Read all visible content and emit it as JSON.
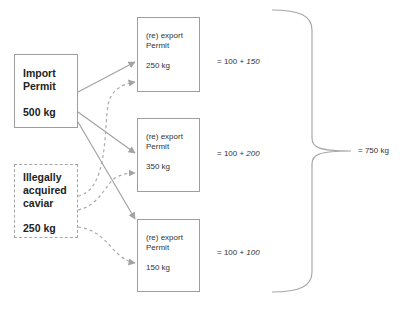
{
  "colors": {
    "line": "#a3a3a3",
    "box_border": "#9e9e9e",
    "text": "#222222"
  },
  "import_box": {
    "title_line1": "Import",
    "title_line2": "Permit",
    "amount": "500 kg"
  },
  "illegal_box": {
    "title_line1": "Illegally",
    "title_line2": "acquired",
    "title_line3": "caviar",
    "amount": "250 kg"
  },
  "export_boxes": [
    {
      "title_line1": "(re) export",
      "title_line2": "Permit",
      "amount": "250 kg",
      "equation_prefix": "= 100 + ",
      "equation_italic": "150"
    },
    {
      "title_line1": "(re) export",
      "title_line2": "Permit",
      "amount": "350 kg",
      "equation_prefix": "= 100 + ",
      "equation_italic": "200"
    },
    {
      "title_line1": "(re) export",
      "title_line2": "Permit",
      "amount": "150 kg",
      "equation_prefix": "= 100 + ",
      "equation_italic": "100"
    }
  ],
  "total": "= 750 kg",
  "icons": {
    "arrow": "arrowhead",
    "brace": "right-curly-brace"
  }
}
